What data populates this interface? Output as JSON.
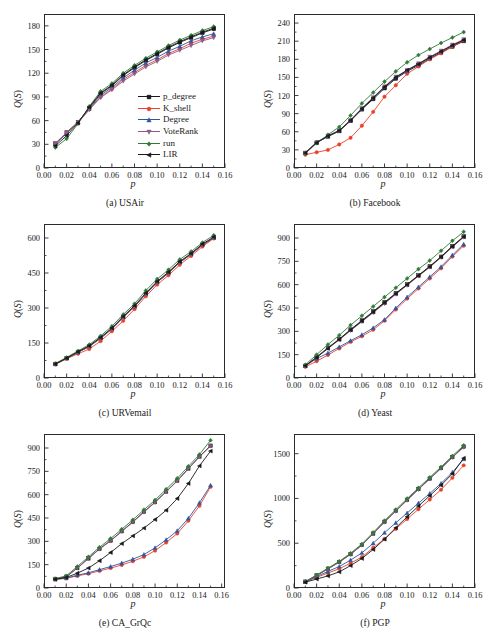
{
  "figure": {
    "xlabel": "p",
    "ylabel_prefix": "Q",
    "ylabel_paren_open": "(",
    "ylabel_S": "S",
    "ylabel_paren_close": ")",
    "ylabel_full": "Q(S)"
  },
  "legend": {
    "position": "inside-lower-right-of-panel-a",
    "entries": [
      {
        "label": "p_degree",
        "color": "#1a1a1a",
        "marker": "square"
      },
      {
        "label": "K_shell",
        "color": "#e8412a",
        "marker": "circle"
      },
      {
        "label": "Degree",
        "color": "#33559e",
        "marker": "triangle-up"
      },
      {
        "label": "VoteRank",
        "color": "#8f5b86",
        "marker": "triangle-down"
      },
      {
        "label": "run",
        "color": "#2f7a36",
        "marker": "diamond"
      },
      {
        "label": "LIR",
        "color": "#1a1a1a",
        "marker": "triangle-left"
      }
    ]
  },
  "chart_data": [
    {
      "id": "a",
      "type": "line",
      "title": "(a) USAir",
      "xlabel": "p",
      "ylabel": "Q(S)",
      "xlim": [
        0.0,
        0.16
      ],
      "ylim": [
        0,
        195
      ],
      "xticks": [
        "0.00",
        "0.02",
        "0.04",
        "0.06",
        "0.08",
        "0.10",
        "0.12",
        "0.14",
        "0.16"
      ],
      "xtickvals": [
        0.0,
        0.02,
        0.04,
        0.06,
        0.08,
        0.1,
        0.12,
        0.14,
        0.16
      ],
      "yticks": [
        "0",
        "30",
        "60",
        "90",
        "120",
        "150",
        "180"
      ],
      "ytickvals": [
        0,
        30,
        60,
        90,
        120,
        150,
        180
      ],
      "grid": false,
      "legend": true,
      "x": [
        0.01,
        0.02,
        0.03,
        0.04,
        0.05,
        0.06,
        0.07,
        0.08,
        0.09,
        0.1,
        0.11,
        0.12,
        0.13,
        0.14,
        0.15
      ],
      "series": [
        {
          "name": "p_degree",
          "values": [
            31,
            45,
            58,
            76,
            94,
            104,
            117,
            127,
            136,
            144,
            152,
            159,
            165,
            171,
            176
          ]
        },
        {
          "name": "K_shell",
          "values": [
            31,
            44,
            57,
            74,
            90,
            100,
            112,
            121,
            130,
            137,
            145,
            151,
            158,
            163,
            167
          ]
        },
        {
          "name": "Degree",
          "values": [
            30,
            44,
            58,
            75,
            92,
            102,
            114,
            124,
            133,
            140,
            148,
            154,
            161,
            166,
            170
          ]
        },
        {
          "name": "VoteRank",
          "values": [
            31,
            45,
            58,
            74,
            89,
            99,
            110,
            119,
            128,
            135,
            143,
            149,
            155,
            161,
            165
          ]
        },
        {
          "name": "run",
          "values": [
            26,
            37,
            56,
            78,
            97,
            107,
            120,
            130,
            139,
            147,
            155,
            162,
            168,
            174,
            179
          ]
        },
        {
          "name": "LIR",
          "values": [
            28,
            41,
            57,
            77,
            95,
            105,
            118,
            128,
            137,
            145,
            153,
            160,
            166,
            172,
            177
          ]
        }
      ]
    },
    {
      "id": "b",
      "type": "line",
      "title": "(b) Facebook",
      "xlabel": "p",
      "ylabel": "Q(S)",
      "xlim": [
        0.0,
        0.16
      ],
      "ylim": [
        0,
        255
      ],
      "xticks": [
        "0.00",
        "0.02",
        "0.04",
        "0.06",
        "0.08",
        "0.10",
        "0.12",
        "0.14",
        "0.16"
      ],
      "xtickvals": [
        0.0,
        0.02,
        0.04,
        0.06,
        0.08,
        0.1,
        0.12,
        0.14,
        0.16
      ],
      "yticks": [
        "0",
        "30",
        "60",
        "90",
        "120",
        "150",
        "180",
        "210",
        "240"
      ],
      "ytickvals": [
        0,
        30,
        60,
        90,
        120,
        150,
        180,
        210,
        240
      ],
      "grid": false,
      "legend": false,
      "x": [
        0.01,
        0.02,
        0.03,
        0.04,
        0.05,
        0.06,
        0.07,
        0.08,
        0.09,
        0.1,
        0.11,
        0.12,
        0.13,
        0.14,
        0.15
      ],
      "series": [
        {
          "name": "p_degree",
          "values": [
            25,
            42,
            52,
            61,
            78,
            97,
            114,
            132,
            148,
            160,
            170,
            181,
            191,
            201,
            210
          ]
        },
        {
          "name": "K_shell",
          "values": [
            22,
            26,
            30,
            39,
            50,
            70,
            93,
            118,
            137,
            156,
            168,
            180,
            190,
            201,
            211
          ]
        },
        {
          "name": "Degree",
          "values": [
            25,
            43,
            53,
            62,
            79,
            98,
            116,
            134,
            150,
            161,
            172,
            183,
            193,
            203,
            212
          ]
        },
        {
          "name": "VoteRank",
          "values": [
            25,
            42,
            53,
            62,
            79,
            99,
            117,
            135,
            151,
            162,
            173,
            184,
            194,
            204,
            213
          ]
        },
        {
          "name": "run",
          "values": [
            24,
            41,
            55,
            68,
            87,
            107,
            125,
            143,
            160,
            175,
            187,
            197,
            207,
            216,
            225
          ]
        },
        {
          "name": "LIR",
          "values": [
            25,
            42,
            53,
            62,
            79,
            98,
            116,
            134,
            150,
            162,
            172,
            183,
            193,
            203,
            212
          ]
        }
      ]
    },
    {
      "id": "c",
      "type": "line",
      "title": "(c) URVemail",
      "xlabel": "p",
      "ylabel": "Q(S)",
      "xlim": [
        0.0,
        0.16
      ],
      "ylim": [
        0,
        660
      ],
      "xticks": [
        "0.00",
        "0.02",
        "0.04",
        "0.06",
        "0.08",
        "0.10",
        "0.12",
        "0.14",
        "0.16"
      ],
      "xtickvals": [
        0.0,
        0.02,
        0.04,
        0.06,
        0.08,
        0.1,
        0.12,
        0.14,
        0.16
      ],
      "yticks": [
        "0",
        "150",
        "300",
        "450",
        "600"
      ],
      "ytickvals": [
        0,
        150,
        300,
        450,
        600
      ],
      "grid": false,
      "legend": false,
      "x": [
        0.01,
        0.02,
        0.03,
        0.04,
        0.05,
        0.06,
        0.07,
        0.08,
        0.09,
        0.1,
        0.11,
        0.12,
        0.13,
        0.14,
        0.15
      ],
      "series": [
        {
          "name": "p_degree",
          "values": [
            60,
            85,
            110,
            135,
            170,
            210,
            260,
            305,
            360,
            410,
            450,
            495,
            530,
            570,
            600
          ]
        },
        {
          "name": "K_shell",
          "values": [
            58,
            82,
            104,
            124,
            158,
            200,
            245,
            295,
            350,
            400,
            440,
            485,
            523,
            563,
            598
          ]
        },
        {
          "name": "Degree",
          "values": [
            60,
            85,
            110,
            137,
            172,
            212,
            262,
            307,
            362,
            412,
            452,
            497,
            532,
            572,
            602
          ]
        },
        {
          "name": "VoteRank",
          "values": [
            60,
            85,
            110,
            136,
            171,
            211,
            261,
            306,
            361,
            411,
            451,
            496,
            531,
            571,
            601
          ]
        },
        {
          "name": "run",
          "values": [
            62,
            88,
            116,
            143,
            180,
            222,
            272,
            318,
            375,
            424,
            464,
            508,
            542,
            580,
            612
          ]
        },
        {
          "name": "LIR",
          "values": [
            60,
            85,
            112,
            138,
            174,
            214,
            264,
            310,
            364,
            414,
            454,
            499,
            534,
            574,
            604
          ]
        }
      ]
    },
    {
      "id": "d",
      "type": "line",
      "title": "(d) Yeast",
      "xlabel": "p",
      "ylabel": "Q(S)",
      "xlim": [
        0.0,
        0.16
      ],
      "ylim": [
        0,
        990
      ],
      "xticks": [
        "0.00",
        "0.02",
        "0.04",
        "0.06",
        "0.08",
        "0.10",
        "0.12",
        "0.14",
        "0.16"
      ],
      "xtickvals": [
        0.0,
        0.02,
        0.04,
        0.06,
        0.08,
        0.1,
        0.12,
        0.14,
        0.16
      ],
      "yticks": [
        "0",
        "150",
        "300",
        "450",
        "600",
        "750",
        "900"
      ],
      "ytickvals": [
        0,
        150,
        300,
        450,
        600,
        750,
        900
      ],
      "grid": false,
      "legend": false,
      "x": [
        0.01,
        0.02,
        0.03,
        0.04,
        0.05,
        0.06,
        0.07,
        0.08,
        0.09,
        0.1,
        0.11,
        0.12,
        0.13,
        0.14,
        0.15
      ],
      "series": [
        {
          "name": "p_degree",
          "values": [
            78,
            135,
            195,
            250,
            312,
            370,
            428,
            487,
            545,
            602,
            660,
            718,
            780,
            848,
            910
          ]
        },
        {
          "name": "K_shell",
          "values": [
            72,
            108,
            148,
            190,
            232,
            268,
            310,
            368,
            440,
            510,
            575,
            640,
            705,
            780,
            850
          ]
        },
        {
          "name": "Degree",
          "values": [
            78,
            125,
            160,
            200,
            240,
            278,
            322,
            375,
            450,
            520,
            585,
            650,
            715,
            790,
            860
          ]
        },
        {
          "name": "VoteRank",
          "values": [
            78,
            135,
            190,
            245,
            305,
            362,
            420,
            478,
            538,
            596,
            655,
            712,
            775,
            842,
            905
          ]
        },
        {
          "name": "run",
          "values": [
            85,
            150,
            215,
            275,
            340,
            400,
            460,
            520,
            580,
            640,
            700,
            755,
            818,
            882,
            940
          ]
        },
        {
          "name": "LIR",
          "values": [
            78,
            132,
            190,
            248,
            308,
            366,
            424,
            483,
            542,
            600,
            658,
            715,
            778,
            845,
            908
          ]
        }
      ]
    },
    {
      "id": "e",
      "type": "line",
      "title": "(e) CA_GrQc",
      "xlabel": "p",
      "ylabel": "Q(S)",
      "xlim": [
        0.0,
        0.163
      ],
      "ylim": [
        0,
        990
      ],
      "xticks": [
        "0.00",
        "0.02",
        "0.04",
        "0.06",
        "0.08",
        "0.10",
        "0.12",
        "0.14",
        "0.16"
      ],
      "xtickvals": [
        0.0,
        0.02,
        0.04,
        0.06,
        0.08,
        0.1,
        0.12,
        0.14,
        0.16
      ],
      "yticks": [
        "0",
        "150",
        "300",
        "450",
        "600",
        "750",
        "900"
      ],
      "ytickvals": [
        0,
        150,
        300,
        450,
        600,
        750,
        900
      ],
      "grid": false,
      "legend": false,
      "x": [
        0.01,
        0.02,
        0.03,
        0.04,
        0.05,
        0.06,
        0.07,
        0.08,
        0.09,
        0.1,
        0.11,
        0.12,
        0.13,
        0.14,
        0.15
      ],
      "series": [
        {
          "name": "p_degree",
          "values": [
            58,
            72,
            128,
            190,
            252,
            305,
            365,
            425,
            490,
            552,
            620,
            690,
            768,
            845,
            915
          ]
        },
        {
          "name": "K_shell",
          "values": [
            55,
            62,
            78,
            92,
            110,
            128,
            148,
            172,
            200,
            240,
            292,
            350,
            432,
            528,
            650
          ]
        },
        {
          "name": "Degree",
          "values": [
            56,
            64,
            82,
            98,
            118,
            138,
            160,
            185,
            215,
            258,
            310,
            368,
            448,
            548,
            660
          ]
        },
        {
          "name": "VoteRank",
          "values": [
            58,
            72,
            128,
            190,
            250,
            303,
            363,
            423,
            488,
            550,
            618,
            688,
            766,
            843,
            912
          ]
        },
        {
          "name": "run",
          "values": [
            60,
            78,
            138,
            200,
            262,
            318,
            378,
            438,
            503,
            565,
            635,
            705,
            782,
            858,
            950
          ]
        },
        {
          "name": "LIR",
          "values": [
            56,
            68,
            95,
            128,
            175,
            228,
            285,
            335,
            385,
            440,
            500,
            575,
            672,
            785,
            880
          ]
        }
      ]
    },
    {
      "id": "f",
      "type": "line",
      "title": "(f) PGP",
      "xlabel": "p",
      "ylabel": "Q(S)",
      "xlim": [
        0.0,
        0.16
      ],
      "ylim": [
        0,
        1720
      ],
      "xticks": [
        "0.00",
        "0.02",
        "0.04",
        "0.06",
        "0.08",
        "0.10",
        "0.12",
        "0.14",
        "0.16"
      ],
      "xtickvals": [
        0.0,
        0.02,
        0.04,
        0.06,
        0.08,
        0.1,
        0.12,
        0.14,
        0.16
      ],
      "yticks": [
        "0",
        "500",
        "1000",
        "1500"
      ],
      "ytickvals": [
        0,
        500,
        1000,
        1500
      ],
      "grid": false,
      "legend": false,
      "x": [
        0.01,
        0.02,
        0.03,
        0.04,
        0.05,
        0.06,
        0.07,
        0.08,
        0.09,
        0.1,
        0.11,
        0.12,
        0.13,
        0.14,
        0.15
      ],
      "series": [
        {
          "name": "p_degree",
          "values": [
            70,
            140,
            215,
            290,
            378,
            480,
            608,
            740,
            862,
            985,
            1105,
            1222,
            1340,
            1462,
            1580
          ]
        },
        {
          "name": "K_shell",
          "values": [
            70,
            118,
            168,
            215,
            278,
            345,
            450,
            548,
            660,
            770,
            880,
            988,
            1098,
            1230,
            1370
          ]
        },
        {
          "name": "Degree",
          "values": [
            70,
            128,
            185,
            240,
            312,
            392,
            500,
            618,
            728,
            838,
            948,
            1055,
            1168,
            1292,
            1440
          ]
        },
        {
          "name": "VoteRank",
          "values": [
            70,
            140,
            212,
            288,
            375,
            478,
            605,
            735,
            858,
            980,
            1100,
            1218,
            1335,
            1458,
            1572
          ]
        },
        {
          "name": "run",
          "values": [
            72,
            145,
            222,
            298,
            388,
            492,
            620,
            752,
            875,
            998,
            1118,
            1235,
            1352,
            1475,
            1592
          ]
        },
        {
          "name": "LIR",
          "values": [
            65,
            100,
            135,
            180,
            250,
            330,
            430,
            545,
            672,
            795,
            915,
            1030,
            1148,
            1275,
            1450
          ]
        }
      ]
    }
  ]
}
